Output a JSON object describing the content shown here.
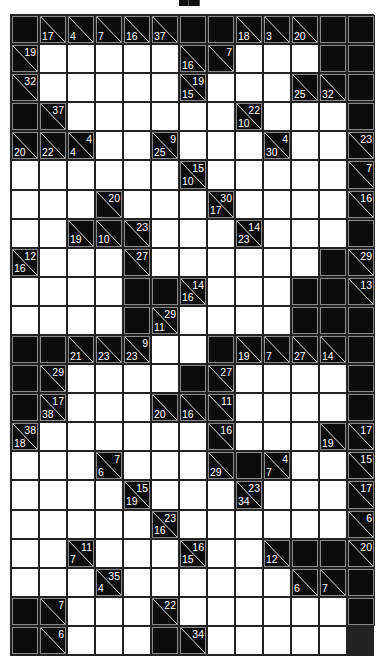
{
  "puzzle": {
    "type": "kakuro",
    "cols": 13,
    "rows": 22,
    "legend": "Each row is a list of cells: 'B' = blocked black cell, 'W' = empty white entry cell, object = clue cell with optional across (a) and down (d) sums",
    "grid": [
      [
        "B",
        {
          "d": 17
        },
        {
          "d": 4
        },
        {
          "d": 7
        },
        {
          "d": 16
        },
        {
          "d": 37
        },
        "B",
        "B",
        {
          "d": 18
        },
        {
          "d": 3
        },
        {
          "d": 20
        },
        "B",
        "B"
      ],
      [
        {
          "a": 19
        },
        "W",
        "W",
        "W",
        "W",
        "W",
        {
          "d": 16
        },
        {
          "a": 7
        },
        "W",
        "W",
        "W",
        "B",
        "B"
      ],
      [
        {
          "a": 32
        },
        "W",
        "W",
        "W",
        "W",
        "W",
        {
          "d": 15,
          "a": 19
        },
        "W",
        "W",
        "W",
        {
          "d": 25
        },
        {
          "d": 32
        }
      ],
      [
        "B",
        "B",
        {
          "a": 37
        },
        "W",
        "W",
        "W",
        "W",
        "W",
        "W",
        {
          "d": 10,
          "a": 22
        },
        "W",
        "W",
        "W"
      ],
      [
        "B",
        {
          "d": 20
        },
        {
          "d": 22
        },
        {
          "d": 4,
          "a": 4
        },
        "W",
        "W",
        {
          "d": 25,
          "a": 9
        },
        "W",
        "W",
        "W",
        {
          "d": 30,
          "a": 4
        },
        "W",
        "W"
      ],
      [
        {
          "a": 23
        },
        "W",
        "W",
        "W",
        "W",
        "W",
        "W",
        {
          "d": 10,
          "a": 15
        },
        "W",
        "W",
        "W",
        "W",
        "W"
      ],
      [
        {
          "a": 7
        },
        "W",
        "W",
        "W",
        {
          "a": 20
        },
        "W",
        "W",
        "W",
        {
          "d": 17,
          "a": 30
        },
        "W",
        "W",
        "W",
        "W"
      ],
      [
        {
          "a": 16
        },
        "W",
        "W",
        {
          "d": 19
        },
        {
          "d": 10
        },
        {
          "a": 23
        },
        "W",
        "W",
        "W",
        {
          "d": 23,
          "a": 14
        },
        "W",
        "W",
        "W"
      ],
      [
        "B",
        {
          "d": 16,
          "a": 12
        },
        "W",
        "W",
        "W",
        {
          "a": 27
        },
        "W",
        "W",
        "W",
        "W",
        "W",
        "W",
        "B"
      ],
      [
        {
          "a": 29
        },
        "W",
        "W",
        "W",
        "W",
        "B",
        "B",
        {
          "d": 16,
          "a": 14
        },
        "W",
        "W",
        "W",
        "B",
        "B"
      ],
      [
        {
          "a": 13
        },
        "W",
        "W",
        "W",
        "W",
        "B",
        {
          "d": 11,
          "a": 29
        },
        "W",
        "W",
        "W",
        "W",
        "B",
        "B"
      ],
      [
        "B",
        "B",
        "B",
        {
          "d": 21
        },
        {
          "d": 23
        },
        {
          "d": 23,
          "a": 9
        },
        "W",
        "W",
        "B",
        {
          "d": 19
        },
        {
          "d": 7
        },
        {
          "d": 27
        },
        {
          "d": 14
        }
      ],
      [
        "B",
        "B",
        {
          "a": 29
        },
        "W",
        "W",
        "W",
        "W",
        "B",
        {
          "a": 27
        },
        "W",
        "W",
        "W",
        "W"
      ],
      [
        "B",
        "B",
        {
          "d": 38,
          "a": 17
        },
        "W",
        "W",
        "W",
        {
          "d": 20
        },
        {
          "d": 16
        },
        {
          "a": 11
        },
        "W",
        "W",
        "W",
        "W"
      ],
      [
        "B",
        {
          "d": 18,
          "a": 38
        },
        "W",
        "W",
        "W",
        "W",
        "W",
        "W",
        {
          "a": 16
        },
        "W",
        "W",
        "W",
        {
          "d": 19
        }
      ],
      [
        {
          "a": 17
        },
        "W",
        "W",
        "W",
        {
          "d": 6,
          "a": 7
        },
        "W",
        "W",
        "W",
        {
          "d": 29
        },
        "B",
        {
          "d": 7,
          "a": 4
        },
        "W",
        "W"
      ],
      [
        {
          "a": 15
        },
        "W",
        "W",
        "W",
        "W",
        {
          "d": 19,
          "a": 15
        },
        "W",
        "W",
        "W",
        {
          "d": 34,
          "a": 23
        },
        "W",
        "W",
        "W"
      ],
      [
        {
          "a": 17
        },
        "W",
        "W",
        "W",
        "W",
        "W",
        {
          "d": 16,
          "a": 23
        },
        "W",
        "W",
        "W",
        "W",
        "W",
        "W"
      ],
      [
        {
          "a": 6
        },
        "W",
        "W",
        {
          "d": 7,
          "a": 11
        },
        "W",
        "W",
        "W",
        {
          "d": 15,
          "a": 16
        },
        "W",
        "W",
        {
          "d": 12
        },
        "B",
        "B"
      ],
      [
        {
          "a": 20
        },
        "W",
        "W",
        "W",
        {
          "d": 4,
          "a": 35
        },
        "W",
        "W",
        "W",
        "W",
        "W",
        "W",
        {
          "d": 6
        },
        {
          "d": 7
        }
      ],
      [
        "B",
        "B",
        {
          "a": 7
        },
        "W",
        "W",
        "W",
        {
          "a": 22
        },
        "W",
        "W",
        "W",
        "W",
        "W",
        "W"
      ],
      [
        "B",
        "B",
        {
          "a": 6
        },
        "W",
        "W",
        "W",
        "B",
        {
          "a": 34
        },
        "W",
        "W",
        "W",
        "W",
        "W"
      ]
    ]
  },
  "colors": {
    "block": "#0c0c0c",
    "white_cell": "#ffffff",
    "grid_line": "#222222",
    "clue_border": "#8a8a8a",
    "clue_text": "#ffffff"
  }
}
